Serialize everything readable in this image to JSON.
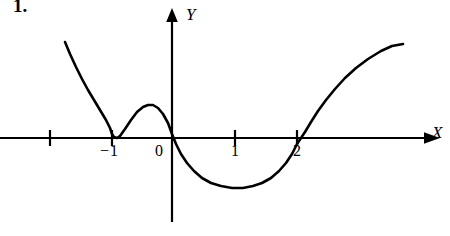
{
  "figure": {
    "problem_number": "1.",
    "background_color": "#ffffff",
    "ink_color": "#000000",
    "width": 450,
    "height": 236
  },
  "axes": {
    "x_axis_label": "X",
    "y_axis_label": "Y",
    "origin_label": "0",
    "x_axis_pixel_y": 138,
    "y_axis_pixel_x": 172,
    "pixels_per_unit": 62,
    "tick_labels": [
      {
        "text": "−1",
        "value": -1
      },
      {
        "text": "0",
        "value": 0
      },
      {
        "text": "1",
        "value": 1
      },
      {
        "text": "2",
        "value": 2
      }
    ],
    "tick_marks": [
      {
        "value": -2,
        "labeled": false
      },
      {
        "value": -1,
        "labeled": true
      },
      {
        "value": 1,
        "labeled": true
      },
      {
        "value": 2,
        "labeled": true
      }
    ]
  },
  "chart_data": {
    "type": "line",
    "title": "",
    "xlabel": "X",
    "ylabel": "Y",
    "grid": false,
    "legend": null,
    "xlim": [
      -1.75,
      3.75
    ],
    "ylim": [
      -1.35,
      1.55
    ],
    "roots": [
      -1,
      0,
      2
    ],
    "root_multiplicities": [
      2,
      1,
      1
    ],
    "features": [
      {
        "name": "tangent-root",
        "x": -1,
        "y": 0
      },
      {
        "name": "local-maximum",
        "x": -0.44,
        "y": 0.53
      },
      {
        "name": "root-crossing-origin",
        "x": 0,
        "y": 0
      },
      {
        "name": "local-minimum",
        "x": 1.15,
        "y": -0.81
      },
      {
        "name": "root-crossing",
        "x": 2,
        "y": 0
      }
    ],
    "series": [
      {
        "name": "y = (x+1)^2 * x * (x-2)",
        "points_pixel": [
          [
            65,
            42
          ],
          [
            70,
            54
          ],
          [
            76,
            67
          ],
          [
            82,
            79
          ],
          [
            88,
            90
          ],
          [
            94,
            100
          ],
          [
            100,
            110
          ],
          [
            106,
            120
          ],
          [
            110,
            128
          ],
          [
            112,
            134
          ],
          [
            114,
            137
          ],
          [
            117,
            138
          ],
          [
            120,
            136
          ],
          [
            125,
            129
          ],
          [
            131,
            120
          ],
          [
            137,
            112
          ],
          [
            143,
            107
          ],
          [
            148,
            105
          ],
          [
            153,
            105
          ],
          [
            158,
            108
          ],
          [
            163,
            114
          ],
          [
            168,
            123
          ],
          [
            172,
            134
          ],
          [
            176,
            144
          ],
          [
            181,
            154
          ],
          [
            187,
            163
          ],
          [
            194,
            171
          ],
          [
            202,
            178
          ],
          [
            211,
            183
          ],
          [
            221,
            186
          ],
          [
            232,
            188
          ],
          [
            243,
            188
          ],
          [
            253,
            186
          ],
          [
            262,
            183
          ],
          [
            271,
            178
          ],
          [
            279,
            171
          ],
          [
            286,
            163
          ],
          [
            292,
            154
          ],
          [
            297,
            144
          ],
          [
            301,
            138
          ],
          [
            305,
            132
          ],
          [
            311,
            122
          ],
          [
            318,
            111
          ],
          [
            326,
            100
          ],
          [
            335,
            89
          ],
          [
            345,
            78
          ],
          [
            356,
            68
          ],
          [
            368,
            59
          ],
          [
            381,
            51
          ],
          [
            392,
            46
          ],
          [
            403,
            44
          ]
        ]
      }
    ]
  }
}
